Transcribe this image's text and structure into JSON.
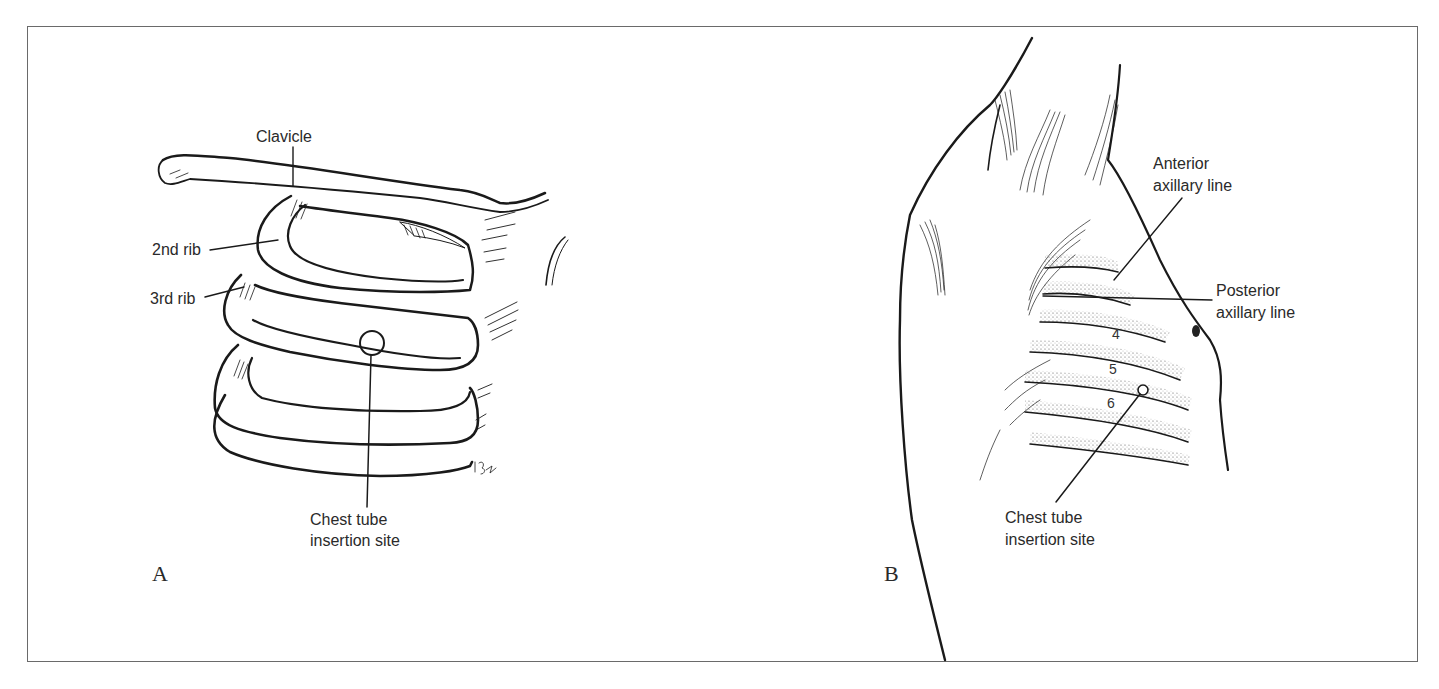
{
  "figure": {
    "border_color": "#6a6a6a",
    "ink_color": "#1a1a1a",
    "panel_a": {
      "letter": "A",
      "labels": {
        "clavicle": "Clavicle",
        "rib2": "2nd rib",
        "rib3": "3rd rib",
        "insertion_line1": "Chest tube",
        "insertion_line2": "insertion site"
      }
    },
    "panel_b": {
      "letter": "B",
      "labels": {
        "anterior_line1": "Anterior",
        "anterior_line2": "axillary line",
        "posterior_line1": "Posterior",
        "posterior_line2": "axillary line",
        "insertion_line1": "Chest tube",
        "insertion_line2": "insertion site"
      },
      "rib_numbers": [
        "4",
        "5",
        "6"
      ]
    }
  }
}
